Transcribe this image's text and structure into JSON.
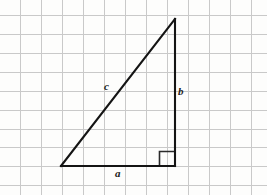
{
  "figure": {
    "background_color": "#fdfdfc",
    "grid": {
      "visible": true,
      "color": "#c9c9c9",
      "line_width": 1,
      "spacing_x": 21,
      "spacing_y": 19.5,
      "origin_x": 20,
      "origin_y": 15,
      "columns": 12,
      "rows": 10
    },
    "triangle": {
      "stroke_color": "#1a1a1a",
      "line_width": 2,
      "vertices": {
        "bottom_left": [
          61,
          166
        ],
        "bottom_right": [
          175,
          166
        ],
        "top_right": [
          175,
          19
        ]
      },
      "right_angle_marker": {
        "visible": true,
        "corner": "bottom-right",
        "size": 15
      }
    },
    "labels": {
      "hypotenuse": "c",
      "vertical_leg": "b",
      "horizontal_leg": "a"
    }
  }
}
